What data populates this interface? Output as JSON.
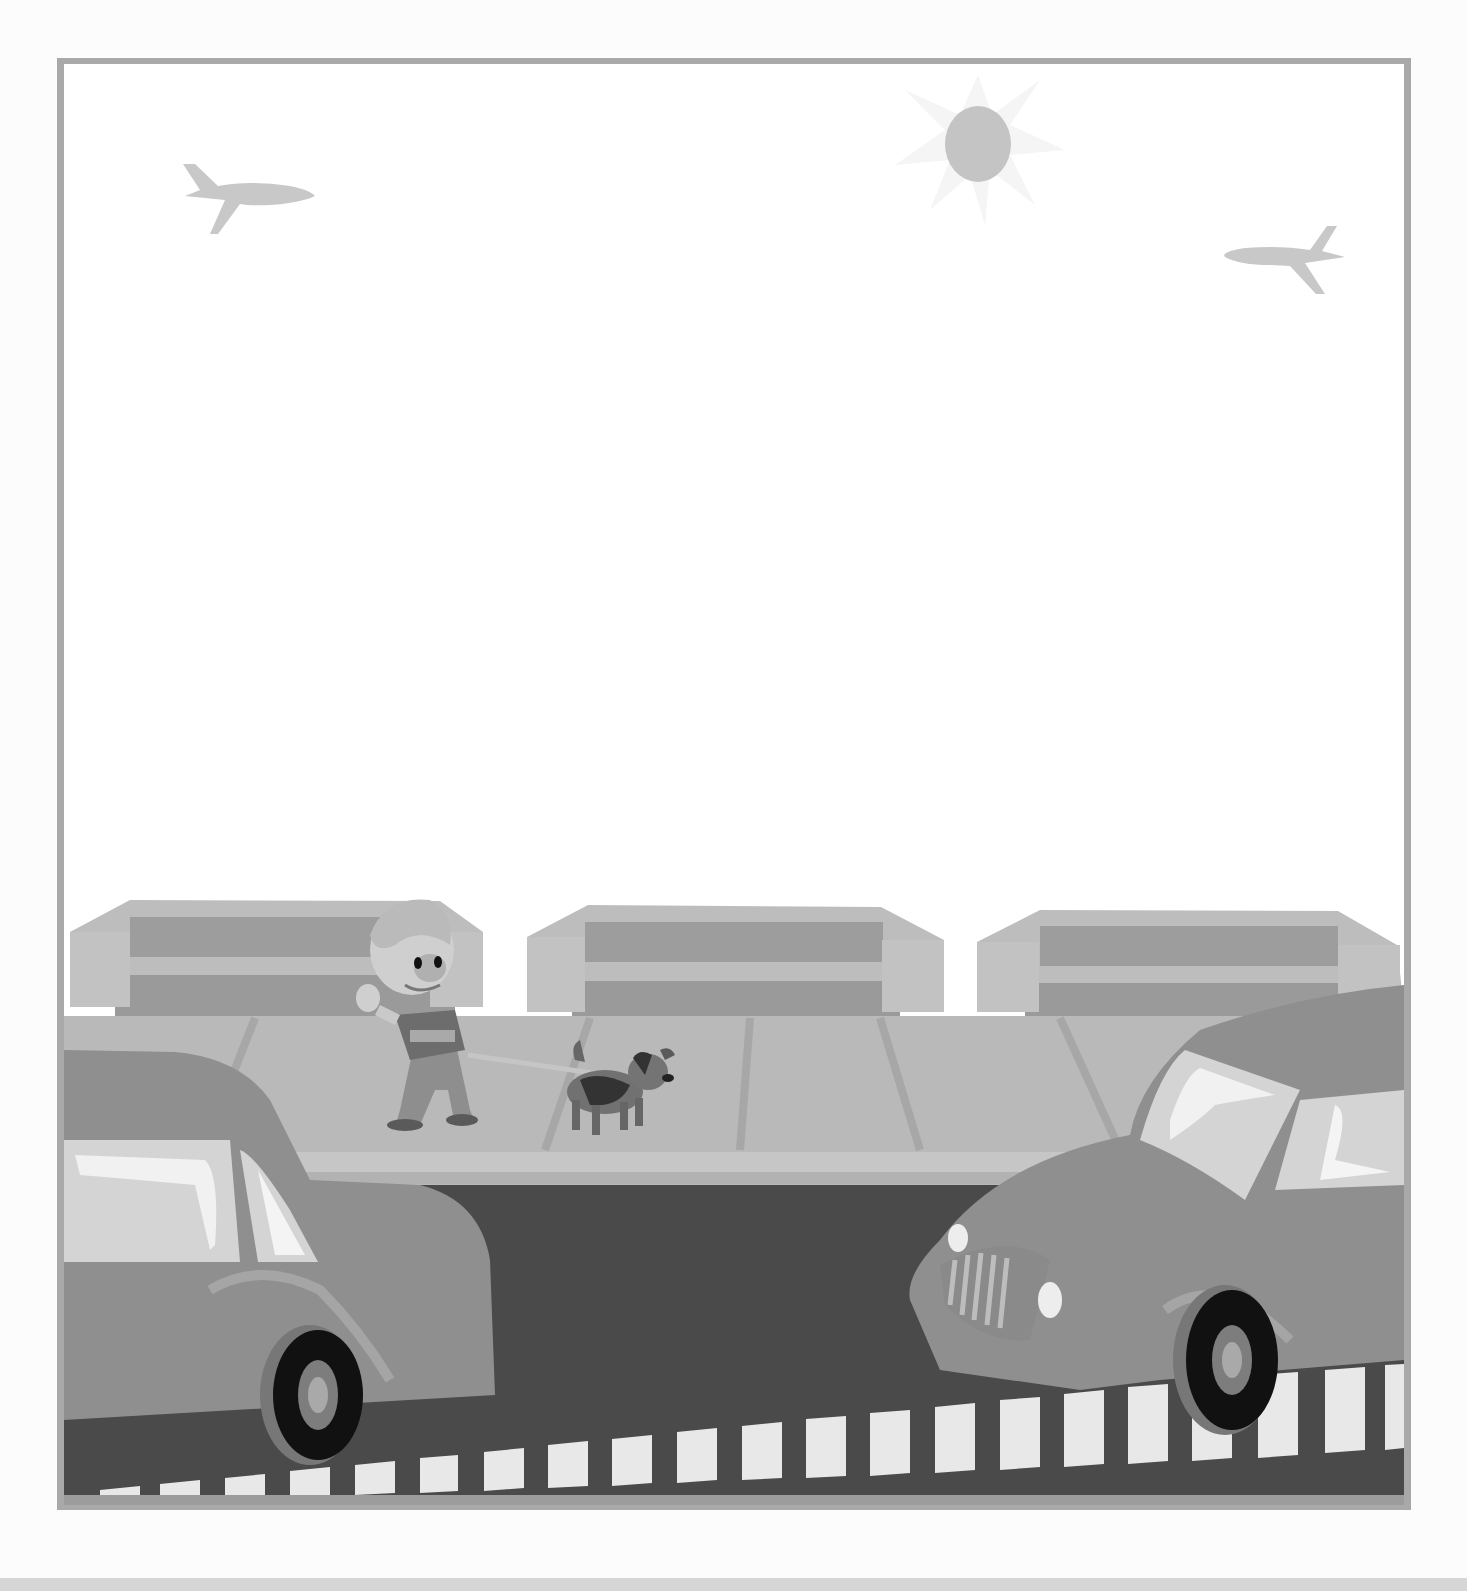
{
  "illustration": {
    "subject": "Cartoon street scene",
    "description": "Grayscale clip-art of a boy walking a dog on a sidewalk in front of three low buildings, with two cars on the road, two airplanes and a sun in the sky",
    "elements": {
      "sky": {
        "planes": 2,
        "sun": 1
      },
      "buildings": 3,
      "people": [
        "boy waving"
      ],
      "animals": [
        "dog on leash"
      ],
      "vehicles": [
        "sedan (left, rear view)",
        "vintage car (right, front view)"
      ],
      "road": {
        "lane_dashes": true
      }
    },
    "palette": {
      "frame": "#a8a8a8",
      "sky": "#ffffff",
      "sun": "#c4c4c4",
      "sun_rays": "#f4f4f4",
      "plane": "#c8c8c8",
      "building_light": "#bdbdbd",
      "building_dark": "#9a9a9a",
      "sidewalk": "#b9b9b9",
      "curb": "#c6c6c6",
      "road": "#4a4a4a",
      "lane_dash": "#e8e8e8",
      "car_body": "#8f8f8f",
      "car_glass": "#dcdcdc",
      "tire": "#111111"
    }
  }
}
